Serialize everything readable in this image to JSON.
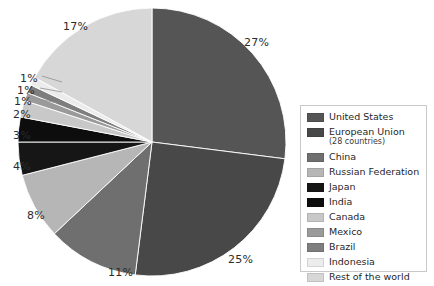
{
  "chart_data": {
    "type": "pie",
    "title": "",
    "subtitle": "",
    "xlabel": "",
    "ylabel": "",
    "legend_position": "right",
    "grid": false,
    "unit": "%",
    "categories": [
      "United States",
      "European Union (28 countries)",
      "China",
      "Russian Federation",
      "Japan",
      "India",
      "Canada",
      "Mexico",
      "Brazil",
      "Indonesia",
      "Rest of the world"
    ],
    "values": [
      27,
      25,
      11,
      8,
      4,
      3,
      2,
      1,
      1,
      1,
      17
    ],
    "slice_colors": [
      "#555555",
      "#484848",
      "#6f6f6f",
      "#b6b6b6",
      "#161616",
      "#0d0d0d",
      "#c8c8c8",
      "#9a9a9a",
      "#7e7e7e",
      "#ececec",
      "#d7d7d7"
    ],
    "data_labels": [
      "27%",
      "25%",
      "11%",
      "8%",
      "4%",
      "3%",
      "2%",
      "1%",
      "1%",
      "1%",
      "17%"
    ]
  },
  "legend": {
    "items": [
      {
        "label": "United States",
        "sub": "",
        "color": "#555555"
      },
      {
        "label": "European Union",
        "sub": "(28 countries)",
        "color": "#484848"
      },
      {
        "label": "China",
        "sub": "",
        "color": "#6f6f6f"
      },
      {
        "label": "Russian Federation",
        "sub": "",
        "color": "#b6b6b6"
      },
      {
        "label": "Japan",
        "sub": "",
        "color": "#161616"
      },
      {
        "label": "India",
        "sub": "",
        "color": "#0d0d0d"
      },
      {
        "label": "Canada",
        "sub": "",
        "color": "#c8c8c8"
      },
      {
        "label": "Mexico",
        "sub": "",
        "color": "#9a9a9a"
      },
      {
        "label": "Brazil",
        "sub": "",
        "color": "#7e7e7e"
      },
      {
        "label": "Indonesia",
        "sub": "",
        "color": "#ececec"
      },
      {
        "label": "Rest of the world",
        "sub": "",
        "color": "#d7d7d7"
      }
    ]
  },
  "pie_labels": [
    {
      "text": "27%",
      "x": 244,
      "y": 36
    },
    {
      "text": "25%",
      "x": 228,
      "y": 253
    },
    {
      "text": "11%",
      "x": 108,
      "y": 266
    },
    {
      "text": "8%",
      "x": 27,
      "y": 209
    },
    {
      "text": "4%",
      "x": 13,
      "y": 160
    },
    {
      "text": "3%",
      "x": 13,
      "y": 129
    },
    {
      "text": "2%",
      "x": 13,
      "y": 108
    },
    {
      "text": "1%",
      "x": 14,
      "y": 95
    },
    {
      "text": "1%",
      "x": 17,
      "y": 84
    },
    {
      "text": "1%",
      "x": 20,
      "y": 72
    },
    {
      "text": "17%",
      "x": 63,
      "y": 20
    }
  ]
}
